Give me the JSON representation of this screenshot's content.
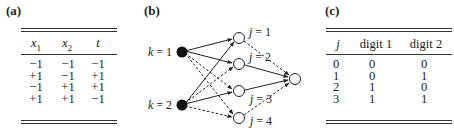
{
  "panels": {
    "a": {
      "label": "(a)",
      "columns": [
        "x1",
        "x2",
        "t"
      ],
      "column_display": [
        {
          "base": "x",
          "sub": "1"
        },
        {
          "base": "x",
          "sub": "2"
        },
        {
          "base": "t",
          "sub": ""
        }
      ],
      "rows": [
        [
          "−1",
          "−1",
          "−1"
        ],
        [
          "+1",
          "−1",
          "+1"
        ],
        [
          "−1",
          "+1",
          "+1"
        ],
        [
          "+1",
          "+1",
          "−1"
        ]
      ]
    },
    "b": {
      "label": "(b)",
      "input_nodes": [
        {
          "label": "k = 1",
          "fill": "#111111"
        },
        {
          "label": "k = 2",
          "fill": "#111111"
        }
      ],
      "hidden_nodes": [
        {
          "label": "j = 1"
        },
        {
          "label": "j = 2"
        },
        {
          "label": "j = 3"
        },
        {
          "label": "j = 4"
        }
      ],
      "output_node": {
        "label": ""
      },
      "edges_solid": [
        [
          "k1",
          "j1"
        ],
        [
          "k1",
          "j2"
        ],
        [
          "k2",
          "j1"
        ],
        [
          "k2",
          "j3"
        ],
        [
          "j2",
          "out"
        ],
        [
          "j3",
          "out"
        ]
      ],
      "edges_dashed": [
        [
          "k1",
          "j3"
        ],
        [
          "k1",
          "j4"
        ],
        [
          "k2",
          "j2"
        ],
        [
          "k2",
          "j4"
        ],
        [
          "j1",
          "out"
        ],
        [
          "j4",
          "out"
        ]
      ]
    },
    "c": {
      "label": "(c)",
      "columns": [
        "j",
        "digit 1",
        "digit 2"
      ],
      "rows": [
        [
          "0",
          "0",
          "0"
        ],
        [
          "1",
          "0",
          "1"
        ],
        [
          "2",
          "1",
          "0"
        ],
        [
          "3",
          "1",
          "1"
        ]
      ]
    }
  }
}
